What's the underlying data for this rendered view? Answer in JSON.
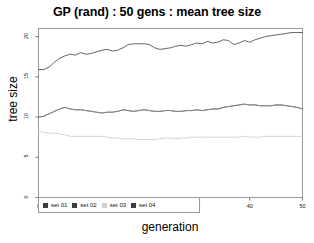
{
  "chart_data": {
    "type": "line",
    "title": "GP (rand) : 50 gens : mean tree size",
    "xlabel": "generation",
    "ylabel": "tree size",
    "xlim": [
      0,
      50
    ],
    "ylim": [
      0,
      21
    ],
    "xticks": [
      0,
      10,
      20,
      30,
      40,
      50
    ],
    "yticks": [
      0,
      5,
      10,
      15,
      20
    ],
    "grid": false,
    "legend_position": "bottom-left",
    "x": [
      0,
      1,
      2,
      3,
      4,
      5,
      6,
      7,
      8,
      9,
      10,
      11,
      12,
      13,
      14,
      15,
      16,
      17,
      18,
      19,
      20,
      21,
      22,
      23,
      24,
      25,
      26,
      27,
      28,
      29,
      30,
      31,
      32,
      33,
      34,
      35,
      36,
      37,
      38,
      39,
      40,
      41,
      42,
      43,
      44,
      45,
      46,
      47,
      48,
      49,
      50
    ],
    "series": [
      {
        "name": "set 01",
        "color": "#555555",
        "values": [
          15.9,
          15.9,
          16.2,
          16.8,
          17.3,
          17.6,
          17.8,
          17.7,
          18.0,
          17.8,
          17.9,
          18.1,
          18.3,
          18.4,
          18.2,
          18.3,
          18.6,
          19.0,
          19.1,
          19.1,
          19.1,
          19.0,
          18.6,
          18.4,
          18.5,
          18.6,
          18.8,
          18.9,
          18.8,
          19.0,
          19.2,
          19.1,
          19.4,
          19.2,
          19.3,
          19.6,
          19.5,
          19.0,
          19.2,
          19.5,
          19.3,
          19.6,
          19.8,
          20.0,
          20.1,
          20.2,
          20.3,
          20.4,
          20.5,
          20.5,
          20.5
        ]
      },
      {
        "name": "set 02",
        "color": "#666666",
        "values": [
          10.0,
          10.1,
          10.4,
          10.7,
          11.0,
          11.2,
          11.0,
          10.9,
          10.9,
          10.8,
          10.7,
          10.6,
          10.5,
          10.6,
          10.6,
          10.7,
          10.9,
          10.8,
          10.7,
          10.8,
          10.9,
          10.8,
          10.7,
          10.7,
          10.8,
          10.8,
          10.7,
          10.7,
          10.8,
          10.8,
          10.9,
          10.8,
          10.9,
          11.0,
          11.0,
          11.2,
          11.3,
          11.4,
          11.5,
          11.6,
          11.5,
          11.5,
          11.4,
          11.4,
          11.4,
          11.5,
          11.5,
          11.4,
          11.3,
          11.2,
          11.0
        ]
      },
      {
        "name": "set 03",
        "color": "#cfcfcf",
        "values": [
          8.2,
          8.1,
          8.0,
          8.0,
          7.9,
          7.8,
          7.6,
          7.6,
          7.6,
          7.6,
          7.6,
          7.6,
          7.6,
          7.5,
          7.4,
          7.4,
          7.3,
          7.3,
          7.3,
          7.2,
          7.2,
          7.2,
          7.2,
          7.3,
          7.4,
          7.4,
          7.3,
          7.4,
          7.4,
          7.5,
          7.5,
          7.5,
          7.5,
          7.5,
          7.5,
          7.5,
          7.5,
          7.5,
          7.5,
          7.6,
          7.5,
          7.5,
          7.5,
          7.6,
          7.6,
          7.6,
          7.6,
          7.6,
          7.6,
          7.6,
          7.6
        ]
      },
      {
        "name": "set 04",
        "color": "#888888",
        "values": [
          10.0,
          10.1,
          10.4,
          10.7,
          11.0,
          11.2,
          11.0,
          10.9,
          10.9,
          10.8,
          10.7,
          10.6,
          10.5,
          10.6,
          10.6,
          10.7,
          10.9,
          10.8,
          10.7,
          10.8,
          10.9,
          10.8,
          10.7,
          10.7,
          10.8,
          10.8,
          10.7,
          10.7,
          10.8,
          10.8,
          10.9,
          10.8,
          10.9,
          11.0,
          11.0,
          11.2,
          11.3,
          11.4,
          11.5,
          11.6,
          11.5,
          11.5,
          11.4,
          11.4,
          11.4,
          11.5,
          11.5,
          11.4,
          11.3,
          11.2,
          11.0
        ]
      }
    ]
  },
  "legend": {
    "entries": [
      {
        "label": "set 01",
        "color": "#3d3d3d"
      },
      {
        "label": "set 02",
        "color": "#3d3d3d"
      },
      {
        "label": "set 03",
        "color": "#d0d0d0"
      },
      {
        "label": "set 04",
        "color": "#3d3d3d"
      }
    ]
  },
  "axes": {
    "ytick_labels": [
      "0",
      "5",
      "10",
      "15",
      "20"
    ],
    "xtick_labels": [
      "0",
      "10",
      "20",
      "30",
      "40",
      "50"
    ]
  }
}
